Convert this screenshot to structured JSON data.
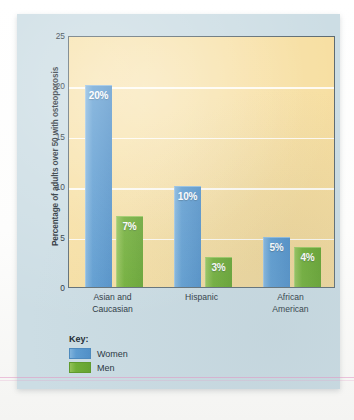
{
  "chart_data": {
    "type": "bar",
    "title": "",
    "xlabel": "",
    "ylabel": "Percentage of adults over 50 with osteoporosis",
    "ylim": [
      0,
      25
    ],
    "yticks": [
      0,
      5,
      10,
      15,
      20,
      25
    ],
    "ytick_labels": [
      "0",
      "5",
      "10",
      "15",
      "20",
      "25"
    ],
    "grid": true,
    "legend_position": "below-plot-left",
    "categories": [
      "Asian and Caucasian",
      "Hispanic",
      "African American"
    ],
    "category_lines": [
      [
        "Asian and",
        "Caucasian"
      ],
      [
        "Hispanic"
      ],
      [
        "African",
        "American"
      ]
    ],
    "series": [
      {
        "name": "Women",
        "color": "#5b9bd1",
        "values": [
          20,
          10,
          5
        ],
        "data_labels": [
          "20%",
          "10%",
          "5%"
        ]
      },
      {
        "name": "Men",
        "color": "#6fae33",
        "values": [
          7,
          3,
          4
        ],
        "data_labels": [
          "7%",
          "3%",
          "4%"
        ]
      }
    ]
  },
  "legend": {
    "title": "Key:",
    "entries": [
      {
        "label": "Women",
        "color": "#5b9bd1"
      },
      {
        "label": "Men",
        "color": "#6fae33"
      }
    ]
  },
  "colors": {
    "panel_background": "#ccdde4",
    "plot_background": "#f7dfa2",
    "plot_border": "#5d6b72",
    "gridline": "#ffffff",
    "women_bar": "#5b9bd1",
    "men_bar": "#6fae33",
    "text": "#27333b"
  }
}
